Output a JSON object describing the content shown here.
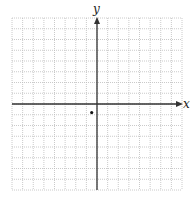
{
  "diagram": {
    "type": "coordinate-grid",
    "axes": {
      "x_label": "x",
      "y_label": "y"
    },
    "grid": {
      "cols": 16,
      "rows": 16,
      "origin_col": 8,
      "origin_row": 8,
      "line_style": "dotted",
      "line_color": "#bdbdbd",
      "axis_color": "#333333"
    },
    "points": [
      {
        "x": -0.5,
        "y": -0.8,
        "label": ""
      }
    ]
  },
  "chart_data": {
    "type": "scatter",
    "title": "",
    "xlabel": "x",
    "ylabel": "y",
    "xlim": [
      -8,
      8
    ],
    "ylim": [
      -8,
      8
    ],
    "grid": true,
    "tick_labels": false,
    "series": [
      {
        "name": "point",
        "x": [
          -0.5
        ],
        "y": [
          -0.8
        ]
      }
    ]
  }
}
